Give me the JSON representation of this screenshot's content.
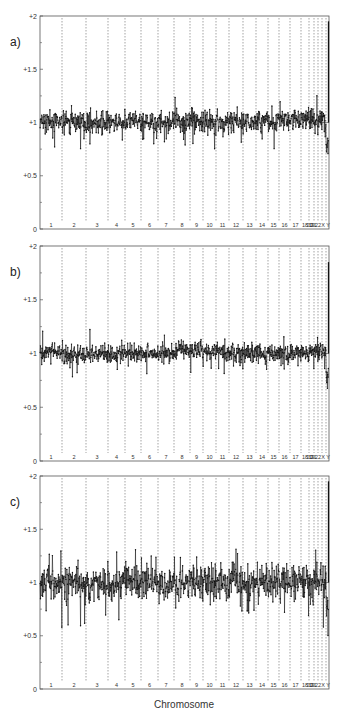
{
  "chart_data": [
    {
      "type": "scatter",
      "panel": "a)",
      "title": "",
      "xlabel": "",
      "ylabel": "",
      "ylim": [
        0,
        2
      ],
      "yticks": [
        "0",
        "+0.5",
        "+1",
        "+1.5",
        "+2"
      ],
      "grid": "vertical dashed lines at chromosome boundaries",
      "categories": [
        "1",
        "2",
        "3",
        "4",
        "5",
        "6",
        "7",
        "8",
        "9",
        "10",
        "11",
        "12",
        "13",
        "14",
        "15",
        "16",
        "17",
        "18",
        "19",
        "20",
        "21",
        "22",
        "X",
        "Y"
      ],
      "series": [
        {
          "name": "log ratio profile",
          "mean_by_chromosome": [
            1.0,
            1.0,
            1.0,
            1.0,
            1.0,
            1.0,
            1.0,
            1.0,
            1.02,
            1.0,
            1.0,
            1.0,
            1.0,
            1.02,
            1.02,
            1.02,
            1.03,
            1.03,
            1.03,
            1.03,
            1.03,
            1.03,
            0.78,
            1.0
          ],
          "spread": 0.07
        }
      ]
    },
    {
      "type": "scatter",
      "panel": "b)",
      "title": "",
      "xlabel": "",
      "ylabel": "",
      "ylim": [
        0,
        2
      ],
      "yticks": [
        "0",
        "+0.5",
        "+1",
        "+1.5",
        "+2"
      ],
      "grid": "vertical dashed lines at chromosome boundaries",
      "categories": [
        "1",
        "2",
        "3",
        "4",
        "5",
        "6",
        "7",
        "8",
        "9",
        "10",
        "11",
        "12",
        "13",
        "14",
        "15",
        "16",
        "17",
        "18",
        "19",
        "20",
        "21",
        "22",
        "X",
        "Y"
      ],
      "series": [
        {
          "name": "log ratio profile",
          "mean_by_chromosome": [
            1.0,
            0.99,
            1.0,
            1.0,
            1.0,
            1.0,
            1.0,
            1.02,
            1.03,
            1.03,
            1.02,
            1.0,
            1.0,
            1.0,
            1.0,
            1.0,
            1.0,
            1.0,
            1.0,
            1.02,
            1.02,
            1.02,
            0.8,
            1.5
          ],
          "spread": 0.06
        }
      ]
    },
    {
      "type": "scatter",
      "panel": "c)",
      "title": "",
      "xlabel": "Chromosome",
      "ylabel": "",
      "ylim": [
        0,
        2
      ],
      "yticks": [
        "0",
        "+0.5",
        "+1",
        "+1.5",
        "+2"
      ],
      "grid": "vertical dashed lines at chromosome boundaries",
      "categories": [
        "1",
        "2",
        "3",
        "4",
        "5",
        "6",
        "7",
        "8",
        "9",
        "10",
        "11",
        "12",
        "13",
        "14",
        "15",
        "16",
        "17",
        "18",
        "19",
        "20",
        "21",
        "22",
        "X",
        "Y"
      ],
      "series": [
        {
          "name": "log ratio profile",
          "mean_by_chromosome": [
            1.0,
            1.0,
            1.0,
            1.0,
            1.0,
            1.0,
            1.0,
            1.0,
            1.0,
            1.0,
            1.0,
            1.0,
            0.98,
            1.0,
            1.0,
            1.0,
            1.0,
            1.0,
            1.0,
            1.0,
            1.0,
            1.0,
            0.78,
            1.0
          ],
          "spread": 0.11
        }
      ]
    }
  ],
  "figure": {
    "panels": [
      "a)",
      "b)",
      "c)"
    ],
    "xlabel": "Chromosome",
    "ytick_labels": [
      "0",
      "+0.5",
      "+1",
      "+1.5",
      "+2"
    ],
    "chromosome_labels": [
      "1",
      "2",
      "3",
      "4",
      "5",
      "6",
      "7",
      "8",
      "9",
      "10",
      "11",
      "12",
      "13",
      "14",
      "15",
      "16",
      "17",
      "18",
      "19",
      "20",
      "21",
      "22",
      "X",
      "Y"
    ]
  }
}
